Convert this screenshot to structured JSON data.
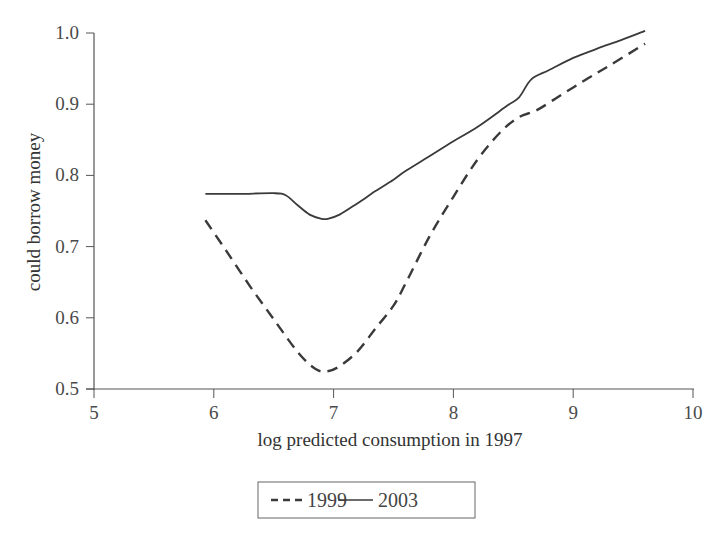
{
  "chart_data": {
    "type": "line",
    "title": "",
    "xlabel": "log predicted consumption in 1997",
    "ylabel": "could borrow money",
    "xlim": [
      5,
      10
    ],
    "ylim": [
      0.5,
      1.0
    ],
    "x_ticks": [
      "5",
      "6",
      "7",
      "8",
      "9",
      "10"
    ],
    "y_ticks": [
      "0.5",
      "0.6",
      "0.7",
      "0.8",
      "0.9",
      "1.0"
    ],
    "grid": false,
    "legend_position": "bottom-center-boxed",
    "series": [
      {
        "name": "1999",
        "style": "dashed",
        "color": "#3a3a3a",
        "x": [
          5.93,
          6.1,
          6.3,
          6.5,
          6.7,
          6.85,
          6.95,
          7.05,
          7.2,
          7.35,
          7.5,
          7.6,
          7.8,
          8.0,
          8.2,
          8.4,
          8.55,
          8.7,
          8.9,
          9.1,
          9.3,
          9.6
        ],
        "y": [
          0.737,
          0.695,
          0.645,
          0.598,
          0.552,
          0.528,
          0.525,
          0.532,
          0.553,
          0.585,
          0.617,
          0.648,
          0.714,
          0.77,
          0.822,
          0.862,
          0.882,
          0.892,
          0.913,
          0.934,
          0.954,
          0.985
        ]
      },
      {
        "name": "2003",
        "style": "solid",
        "color": "#3a3a3a",
        "x": [
          5.93,
          6.2,
          6.5,
          6.6,
          6.7,
          6.8,
          6.9,
          6.95,
          7.05,
          7.2,
          7.35,
          7.5,
          7.6,
          7.8,
          8.0,
          8.2,
          8.45,
          8.55,
          8.65,
          8.8,
          9.0,
          9.2,
          9.4,
          9.6
        ],
        "y": [
          0.774,
          0.774,
          0.775,
          0.772,
          0.758,
          0.745,
          0.739,
          0.739,
          0.745,
          0.761,
          0.778,
          0.794,
          0.806,
          0.827,
          0.848,
          0.868,
          0.898,
          0.91,
          0.935,
          0.948,
          0.965,
          0.978,
          0.99,
          1.003
        ]
      }
    ]
  }
}
